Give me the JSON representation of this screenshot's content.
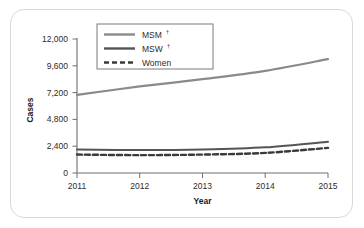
{
  "figure": {
    "frame_color": "#d9d9d9",
    "background": "#ffffff"
  },
  "chart_data": {
    "type": "line",
    "title": "",
    "xlabel": "Year",
    "ylabel": "Cases",
    "x": [
      2011,
      2012,
      2013,
      2014,
      2015
    ],
    "xticklabels": [
      "2011",
      "2012",
      "2013",
      "2014",
      "2015"
    ],
    "yticks": [
      0,
      2400,
      4800,
      7200,
      9600,
      12000
    ],
    "yticklabels": [
      "0",
      "2,400",
      "4,800",
      "7,200",
      "9,600",
      "12,000"
    ],
    "ylim": [
      0,
      12000
    ],
    "xlim": [
      2011,
      2015
    ],
    "grid": false,
    "legend_position": "top-center",
    "series": [
      {
        "name": "MSM",
        "superscript": "†",
        "color": "#8a8a8a",
        "style": "solid",
        "width": 2.2,
        "values": [
          7000,
          7750,
          8400,
          9150,
          10200
        ]
      },
      {
        "name": "MSW",
        "superscript": "†",
        "color": "#555555",
        "style": "solid",
        "width": 2.0,
        "values": [
          2100,
          2050,
          2100,
          2300,
          2800
        ]
      },
      {
        "name": "Women",
        "superscript": "",
        "color": "#3a3a3a",
        "style": "dashed",
        "width": 2.4,
        "values": [
          1650,
          1600,
          1650,
          1800,
          2250
        ]
      }
    ]
  }
}
